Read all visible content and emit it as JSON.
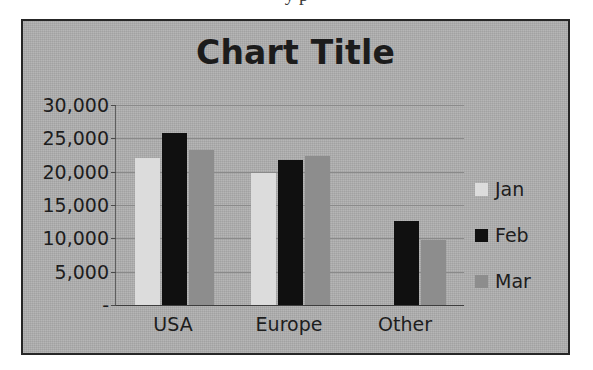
{
  "page": {
    "top_text_fragment": "y p"
  },
  "chart_data": {
    "type": "bar",
    "title": "Chart Title",
    "xlabel": "",
    "ylabel": "",
    "categories": [
      "USA",
      "Europe",
      "Other"
    ],
    "series": [
      {
        "name": "Jan",
        "color": "#dcdcdc",
        "values": [
          22000,
          19800,
          0
        ]
      },
      {
        "name": "Feb",
        "color": "#101010",
        "values": [
          25800,
          21700,
          12600
        ]
      },
      {
        "name": "Mar",
        "color": "#8d8d8d",
        "values": [
          23200,
          22400,
          9800
        ]
      }
    ],
    "ylim": [
      0,
      30000
    ],
    "y_ticks": [
      30000,
      25000,
      20000,
      15000,
      10000,
      5000,
      0
    ],
    "y_tick_labels": [
      "30,000",
      "25,000",
      "20,000",
      "15,000",
      "10,000",
      "5,000",
      "-"
    ],
    "grid": true,
    "legend_position": "right",
    "plot_background": "#b0b0b0",
    "frame_border_color": "#262626"
  }
}
